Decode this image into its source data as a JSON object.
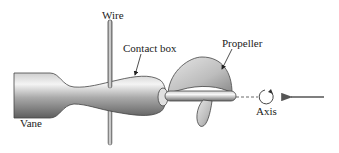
{
  "labels": {
    "wire": "Wire",
    "contact_box": "Contact box",
    "propeller": "Propeller",
    "vane": "Vane",
    "axis": "Axis"
  },
  "colors": {
    "metal_dark": "#6f6f6f",
    "metal_light": "#f2f2f2",
    "line": "#333333",
    "arrow": "#555555"
  }
}
